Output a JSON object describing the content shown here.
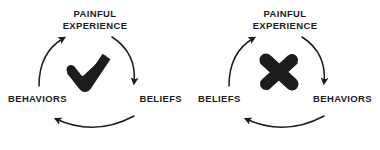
{
  "diagram": {
    "background_color": "#ffffff",
    "text_color": "#1c1c1c",
    "stroke_color": "#1c1c1c",
    "panels": [
      {
        "id": "healthy-cycle",
        "center_symbol": "checkmark",
        "top_label_line1": "PAINFUL",
        "top_label_line2": "EXPERIENCE",
        "left_label": "BEHAVIORS",
        "right_label": "BELIEFS"
      },
      {
        "id": "unhealthy-cycle",
        "center_symbol": "cross",
        "top_label_line1": "PAINFUL",
        "top_label_line2": "EXPERIENCE",
        "left_label": "BELIEFS",
        "right_label": "BEHAVIORS"
      }
    ],
    "arrows": [
      {
        "name": "arc-right-descending",
        "from": "painful-experience",
        "to": "right-node",
        "direction": "clockwise-down"
      },
      {
        "name": "arc-bottom-leftward",
        "from": "right-node",
        "to": "left-node",
        "direction": "right-to-left"
      },
      {
        "name": "arc-left-ascending",
        "from": "left-node",
        "to": "painful-experience",
        "direction": "clockwise-up"
      }
    ]
  }
}
